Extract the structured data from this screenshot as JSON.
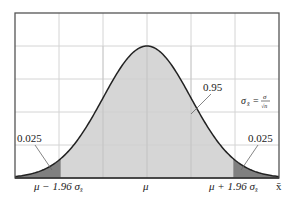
{
  "chart_data": {
    "type": "area",
    "title": "",
    "xlabel": "x̄",
    "ylabel": "",
    "grid": true,
    "x_ticks": [
      {
        "label_prefix": "μ − 1.96 ",
        "label_sigma": "σ",
        "label_sub": "x̄",
        "z": -1.96
      },
      {
        "label_prefix": "μ",
        "label_sigma": "",
        "label_sub": "",
        "z": 0
      },
      {
        "label_prefix": "μ + 1.96 ",
        "label_sigma": "σ",
        "label_sub": "x̄",
        "z": 1.96
      }
    ],
    "regions": [
      {
        "name": "left-tail",
        "area": 0.025,
        "label": "0.025",
        "from_z": -3,
        "to_z": -1.96,
        "color": "#808080"
      },
      {
        "name": "center",
        "area": 0.95,
        "label": "0.95",
        "from_z": -1.96,
        "to_z": 1.96,
        "color": "#cfcfcf"
      },
      {
        "name": "right-tail",
        "area": 0.025,
        "label": "0.025",
        "from_z": 1.96,
        "to_z": 3,
        "color": "#808080"
      }
    ],
    "formula": {
      "lhs": "σ",
      "lhs_sub": "x̄",
      "eq": "=",
      "num": "σ",
      "den": "√n"
    },
    "xlim_z": [
      -3,
      3
    ]
  },
  "labels": {
    "left_tail": "0.025",
    "right_tail": "0.025",
    "center": "0.95",
    "axis_x": "x̄",
    "tick_left_prefix": "μ − 1.96 ",
    "tick_mid": "μ",
    "tick_right_prefix": "μ + 1.96 ",
    "sigma": "σ",
    "sub_xbar": "x̄",
    "formula_lhs": "σ",
    "formula_sub": "x̄",
    "formula_eq": "=",
    "formula_num": "σ",
    "formula_den": "√n"
  },
  "colors": {
    "frame": "#555555",
    "grid": "#d4d4d4",
    "center_fill": "#cfcfcf",
    "tail_fill": "#808080",
    "curve": "#222222"
  }
}
